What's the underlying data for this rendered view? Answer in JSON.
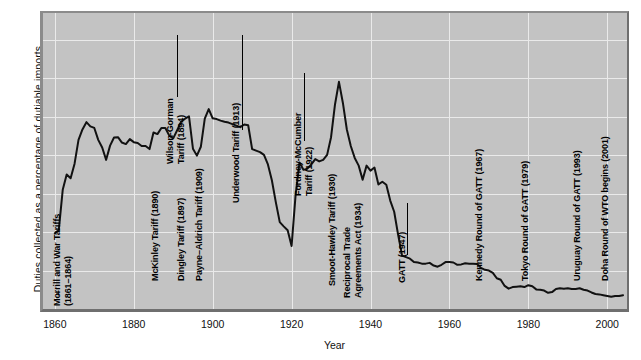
{
  "chart_data": {
    "type": "line",
    "title": "",
    "xlabel": "Year",
    "ylabel": "Duties collected as a percentage of dutiable imports",
    "xlim": [
      1857,
      2005
    ],
    "ylim": [
      0,
      77
    ],
    "grid": true,
    "legend": null,
    "xticks": [
      1860,
      1880,
      1900,
      1920,
      1940,
      1960,
      1980,
      2000
    ],
    "yticks": [
      10,
      20,
      30,
      40,
      50,
      60,
      70
    ],
    "series": [
      {
        "name": "Duties collected as a percentage of dutiable imports",
        "x": [
          1860,
          1861,
          1862,
          1863,
          1864,
          1865,
          1866,
          1867,
          1868,
          1869,
          1870,
          1871,
          1872,
          1873,
          1874,
          1875,
          1876,
          1877,
          1878,
          1879,
          1880,
          1881,
          1882,
          1883,
          1884,
          1885,
          1886,
          1887,
          1888,
          1889,
          1890,
          1891,
          1892,
          1893,
          1894,
          1895,
          1896,
          1897,
          1898,
          1899,
          1900,
          1901,
          1902,
          1903,
          1904,
          1905,
          1906,
          1907,
          1908,
          1909,
          1910,
          1911,
          1912,
          1913,
          1914,
          1915,
          1916,
          1917,
          1918,
          1919,
          1920,
          1921,
          1922,
          1923,
          1924,
          1925,
          1926,
          1927,
          1928,
          1929,
          1930,
          1931,
          1932,
          1933,
          1934,
          1935,
          1936,
          1937,
          1938,
          1939,
          1940,
          1941,
          1942,
          1943,
          1944,
          1945,
          1946,
          1947,
          1948,
          1949,
          1950,
          1951,
          1952,
          1953,
          1954,
          1955,
          1956,
          1957,
          1958,
          1959,
          1960,
          1961,
          1962,
          1963,
          1964,
          1965,
          1966,
          1967,
          1968,
          1969,
          1970,
          1971,
          1972,
          1973,
          1974,
          1975,
          1976,
          1977,
          1978,
          1979,
          1980,
          1981,
          1982,
          1983,
          1984,
          1985,
          1986,
          1987,
          1988,
          1989,
          1990,
          1991,
          1992,
          1993,
          1994,
          1995,
          1996,
          1997,
          1998,
          1999,
          2000,
          2001,
          2002,
          2003,
          2004
        ],
        "y": [
          19.7,
          20.5,
          31.0,
          35.0,
          34.0,
          37.8,
          44.0,
          46.7,
          48.6,
          47.5,
          47.1,
          44.0,
          42.0,
          38.8,
          42.5,
          44.6,
          44.7,
          43.3,
          42.9,
          44.2,
          43.4,
          43.2,
          42.4,
          42.4,
          41.6,
          45.9,
          45.5,
          47.1,
          47.1,
          45.1,
          44.4,
          46.5,
          48.7,
          49.5,
          50.1,
          41.7,
          39.9,
          42.2,
          49.5,
          52.0,
          49.6,
          49.4,
          49.0,
          48.7,
          48.5,
          48.1,
          47.7,
          47.3,
          48.0,
          47.8,
          41.6,
          41.2,
          40.8,
          40.1,
          37.6,
          33.5,
          27.8,
          22.6,
          21.5,
          20.5,
          16.4,
          29.5,
          38.1,
          36.2,
          36.5,
          37.6,
          39.0,
          38.4,
          38.8,
          40.1,
          44.7,
          53.2,
          59.1,
          53.6,
          46.7,
          42.4,
          39.3,
          37.3,
          33.6,
          37.3,
          36.0,
          36.8,
          32.4,
          33.1,
          32.3,
          28.2,
          25.3,
          19.3,
          13.9,
          13.5,
          13.1,
          12.2,
          12.1,
          11.8,
          11.8,
          12.0,
          11.3,
          11.0,
          11.5,
          12.2,
          12.2,
          12.1,
          11.5,
          11.6,
          11.9,
          11.8,
          11.8,
          11.7,
          10.7,
          10.2,
          10.0,
          9.4,
          8.0,
          7.6,
          6.0,
          5.3,
          5.7,
          5.8,
          5.9,
          5.7,
          6.2,
          5.9,
          5.1,
          5.0,
          4.8,
          4.2,
          4.4,
          5.2,
          5.4,
          5.3,
          5.4,
          5.2,
          5.2,
          5.4,
          5.0,
          4.8,
          4.3,
          3.9,
          3.8,
          3.6,
          3.4,
          3.2,
          3.4,
          3.4,
          3.6
        ]
      }
    ],
    "annotations": [
      {
        "id": "morrill",
        "text": "Mo̶rrill and War Tariffs\n(1861–1864)",
        "year": 1862,
        "lines": 2
      },
      {
        "id": "mckinley",
        "text": "McKinley Tariff (1890)",
        "year": 1890,
        "lines": 1
      },
      {
        "id": "wilson-gorman",
        "text": "Wilson-Gorman\nTariff (1894)",
        "year": 1894,
        "lines": 2
      },
      {
        "id": "dingley",
        "text": "Dingley Tariff (1897)",
        "year": 1897,
        "lines": 1
      },
      {
        "id": "payne-aldrich",
        "text": "Payne–Aldrich Tariff (1909)",
        "year": 1909,
        "lines": 1
      },
      {
        "id": "underwood",
        "text": "Underwood Tariff (1913)",
        "year": 1913,
        "lines": 1
      },
      {
        "id": "fordney",
        "text": "Fordney-McCumber\nTariff (1922)",
        "year": 1922,
        "lines": 2
      },
      {
        "id": "smoot-hawley",
        "text": "Smoot-Hawley Tariff (1930)",
        "year": 1930,
        "lines": 1
      },
      {
        "id": "reciprocal",
        "text": "Reciprocal Trade\nAgreements Act (1934)",
        "year": 1934,
        "lines": 2
      },
      {
        "id": "gatt",
        "text": "GATT (1947)",
        "year": 1947,
        "lines": 1
      },
      {
        "id": "kennedy-round",
        "text": "Kennedy Round of GATT (1967)",
        "year": 1967,
        "lines": 1
      },
      {
        "id": "tokyo-round",
        "text": "Tokyo Round of GATT (1979)",
        "year": 1979,
        "lines": 1
      },
      {
        "id": "uruguay-round",
        "text": "Uruguay Round of GATT (1993)",
        "year": 1993,
        "lines": 1
      },
      {
        "id": "doha-round",
        "text": "Doha Round of WTO begins (2001)",
        "year": 2001,
        "lines": 1
      }
    ],
    "colors": {
      "plot_background": "#c3c3c3",
      "gridline": "#eaeaea",
      "line": "#111111",
      "text": "#111111",
      "page_background": "#ffffff"
    }
  }
}
